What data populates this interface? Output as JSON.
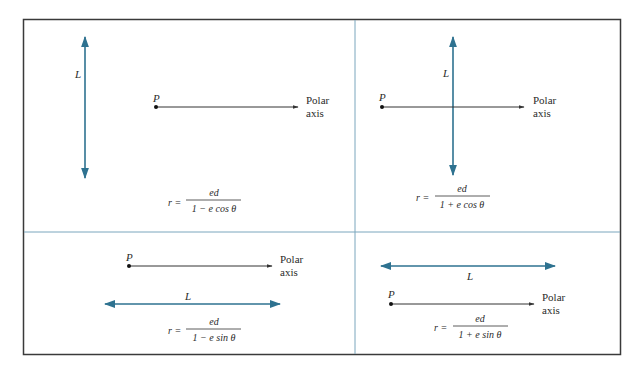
{
  "figure": {
    "colors": {
      "border": "#3a3a3a",
      "divider": "#6fa3c0",
      "directrix": "#2e7290",
      "axis": "#333333",
      "point": "#111111"
    },
    "panels": [
      {
        "id": "top-left",
        "directrix_label": "L",
        "directrix_orientation": "vertical",
        "directrix_side": "left",
        "pole_label": "P",
        "axis_label_line1": "Polar",
        "axis_label_line2": "axis",
        "equation": {
          "lhs": "r =",
          "numerator": "ed",
          "denominator": "1 − e cos θ"
        }
      },
      {
        "id": "top-right",
        "directrix_label": "L",
        "directrix_orientation": "vertical",
        "directrix_side": "right",
        "pole_label": "P",
        "axis_label_line1": "Polar",
        "axis_label_line2": "axis",
        "equation": {
          "lhs": "r =",
          "numerator": "ed",
          "denominator": "1 + e cos θ"
        }
      },
      {
        "id": "bottom-left",
        "directrix_label": "L",
        "directrix_orientation": "horizontal",
        "directrix_side": "below",
        "pole_label": "P",
        "axis_label_line1": "Polar",
        "axis_label_line2": "axis",
        "equation": {
          "lhs": "r =",
          "numerator": "ed",
          "denominator": "1 − e sin θ"
        }
      },
      {
        "id": "bottom-right",
        "directrix_label": "L",
        "directrix_orientation": "horizontal",
        "directrix_side": "above",
        "pole_label": "P",
        "axis_label_line1": "Polar",
        "axis_label_line2": "axis",
        "equation": {
          "lhs": "r =",
          "numerator": "ed",
          "denominator": "1 + e sin θ"
        }
      }
    ]
  }
}
